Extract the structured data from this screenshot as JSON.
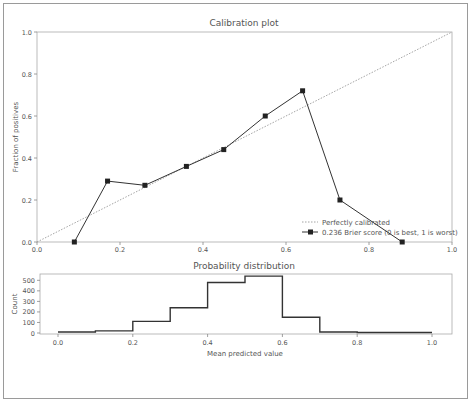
{
  "chart_data": [
    {
      "type": "line",
      "title": "Calibration plot",
      "xlabel": "",
      "ylabel": "Fraction of positives",
      "xlim": [
        0.0,
        1.0
      ],
      "ylim": [
        0.0,
        1.0
      ],
      "xticks": [
        "0.0",
        "0.2",
        "0.4",
        "0.6",
        "0.8",
        "1.0"
      ],
      "yticks": [
        "0.0",
        "0.2",
        "0.4",
        "0.6",
        "0.8",
        "1.0"
      ],
      "grid": false,
      "legend_position": "lower right",
      "series": [
        {
          "name": "Perfectly calibrated",
          "style": "dotted",
          "x": [
            0.0,
            1.0
          ],
          "y": [
            0.0,
            1.0
          ]
        },
        {
          "name": "0.236 Brier score (0 is best, 1 is worst)",
          "style": "solid-square-markers",
          "x": [
            0.09,
            0.17,
            0.26,
            0.36,
            0.45,
            0.55,
            0.64,
            0.73,
            0.88
          ],
          "y": [
            0.0,
            0.29,
            0.27,
            0.36,
            0.44,
            0.6,
            0.72,
            0.2,
            0.0
          ]
        }
      ]
    },
    {
      "type": "bar",
      "subtype": "step-histogram",
      "title": "Probability distribution",
      "xlabel": "Mean predicted value",
      "ylabel": "Count",
      "xlim": [
        0.0,
        1.0
      ],
      "ylim": [
        0,
        560
      ],
      "xticks": [
        "0.0",
        "0.2",
        "0.4",
        "0.6",
        "0.8",
        "1.0"
      ],
      "yticks": [
        "0",
        "100",
        "200",
        "300",
        "400",
        "500"
      ],
      "grid": false,
      "bin_edges": [
        0.0,
        0.1,
        0.2,
        0.3,
        0.4,
        0.5,
        0.6,
        0.7,
        0.8,
        0.9,
        1.0
      ],
      "values": [
        10,
        20,
        110,
        240,
        480,
        540,
        150,
        10,
        5,
        5
      ]
    }
  ],
  "labels": {
    "top_title": "Calibration plot",
    "top_ylabel": "Fraction of positives",
    "legend_perfect": "Perfectly calibrated",
    "legend_brier": "0.236 Brier score (0 is best, 1 is worst)",
    "bottom_title": "Probability distribution",
    "bottom_ylabel": "Count",
    "bottom_xlabel": "Mean predicted value"
  },
  "colors": {
    "line": "#333333",
    "diagonal": "#9a9a9a",
    "axis": "#888888",
    "text": "#555555"
  }
}
